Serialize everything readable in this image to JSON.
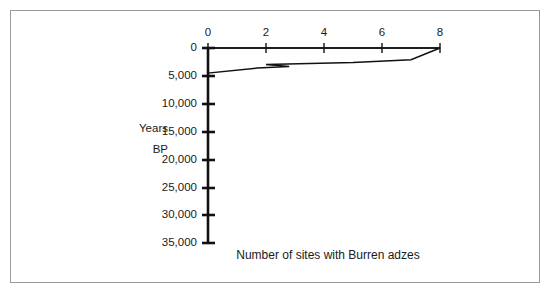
{
  "figure": {
    "caption": "Number of sites with Burren adzes",
    "y_axis_title_line1": "Years",
    "y_axis_title_line2": "BP",
    "border_color": "#9a9a9a",
    "line_color": "#111111",
    "axis_color": "#111111"
  },
  "chart_data": {
    "type": "line",
    "title": "",
    "subtitle": "",
    "xlabel": "Number of sites with Burren adzes",
    "ylabel": "Years BP",
    "orientation": "horizontal",
    "x_axis_position": "top",
    "y_axis_inverted": true,
    "grid": false,
    "legend": false,
    "xlim": [
      0,
      8
    ],
    "ylim": [
      0,
      35000
    ],
    "xticks": [
      0,
      2,
      4,
      6,
      8
    ],
    "xtick_labels": [
      "0",
      "2",
      "4",
      "6",
      "8"
    ],
    "yticks": [
      0,
      5000,
      10000,
      15000,
      20000,
      25000,
      30000,
      35000
    ],
    "ytick_labels": [
      "0",
      "5,000",
      "10,000",
      "15,000",
      "20,000",
      "25,000",
      "30,000",
      "35,000"
    ],
    "series": [
      {
        "name": "Burren adzes",
        "x": [
          0,
          8,
          7.0,
          5.0,
          2.0,
          2.8,
          1.7,
          0.0,
          0.0
        ],
        "y": [
          0,
          0,
          2100,
          2600,
          2950,
          3300,
          3600,
          4500,
          35000
        ],
        "points": [
          {
            "sites": 0,
            "years_bp": 0
          },
          {
            "sites": 8,
            "years_bp": 0
          },
          {
            "sites": 7.0,
            "years_bp": 2100
          },
          {
            "sites": 5.0,
            "years_bp": 2600
          },
          {
            "sites": 2.0,
            "years_bp": 2950
          },
          {
            "sites": 2.8,
            "years_bp": 3300
          },
          {
            "sites": 1.7,
            "years_bp": 3600
          },
          {
            "sites": 0.0,
            "years_bp": 4500
          },
          {
            "sites": 0.0,
            "years_bp": 35000
          }
        ]
      }
    ]
  }
}
